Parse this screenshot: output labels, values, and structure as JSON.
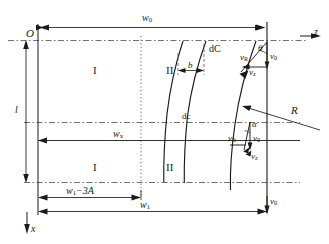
{
  "figure": {
    "width": 329,
    "height": 244,
    "ink_color": "#1a1a1a",
    "dash_color": "#555555"
  },
  "axes": {
    "origin_label": "O",
    "z_axis_label": "z",
    "x_axis_label": "x"
  },
  "dimensions": {
    "w0": {
      "label_main": "w",
      "label_sub": "0"
    },
    "l": {
      "label_main": "l",
      "label_sub": ""
    },
    "wx": {
      "label_main": "w",
      "label_sub": "x"
    },
    "w1_minus_3A": {
      "label_main": "w",
      "label_sub": "1",
      "label_tail": "−3A"
    },
    "w1": {
      "label_main": "w",
      "label_sub": "1"
    },
    "b": {
      "label_main": "b",
      "label_sub": ""
    }
  },
  "regions": [
    {
      "name": "region-I-upper",
      "label": "I"
    },
    {
      "name": "region-II-upper",
      "label": "II"
    },
    {
      "name": "region-I-lower",
      "label": "I"
    },
    {
      "name": "region-II-lower",
      "label": "II"
    }
  ],
  "curve_labels": {
    "dC": "dC",
    "dc": "dc",
    "R": "R"
  },
  "velocity_upper": {
    "vR": {
      "main": "v",
      "sub": "R"
    },
    "v0": {
      "main": "v",
      "sub": "0"
    },
    "vz": {
      "main": "v",
      "sub": "z"
    },
    "angle": "θ"
  },
  "velocity_lower": {
    "vR": {
      "main": "v",
      "sub": "R"
    },
    "v0": {
      "main": "v",
      "sub": "0"
    },
    "vz": {
      "main": "v",
      "sub": "z"
    },
    "angle": "α"
  },
  "velocity_bottom": {
    "v0": {
      "main": "v",
      "sub": "0"
    }
  }
}
